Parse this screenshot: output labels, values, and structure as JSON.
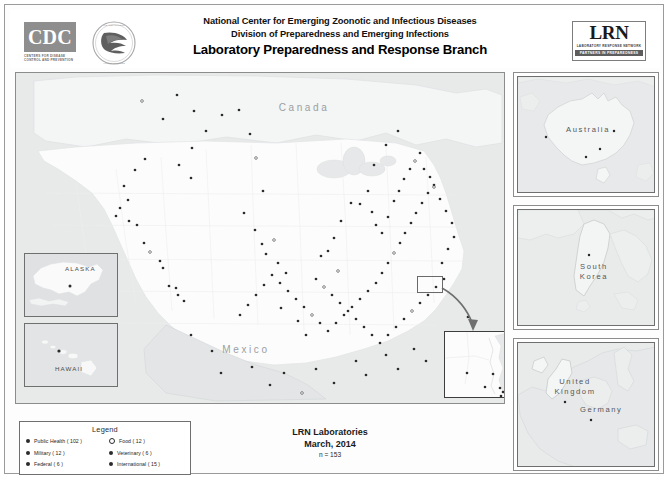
{
  "header": {
    "org_logo": "CDC",
    "cdc_tagline": "CENTERS FOR DISEASE CONTROL AND PREVENTION",
    "line1": "National Center for Emerging Zoonotic and Infectious Diseases",
    "line2": "Division of Preparedness and Emerging Infections",
    "line3": "Laboratory Preparedness and Response Branch",
    "lrn_logo": "LRN",
    "lrn_sub1": "LABORATORY RESPONSE NETWORK",
    "lrn_sub2": "PARTNERS IN PREPAREDNESS"
  },
  "main_map": {
    "country_labels": [
      {
        "name": "Canada",
        "x": 288,
        "y": 38
      },
      {
        "name": "Mexico",
        "x": 230,
        "y": 280
      }
    ],
    "insets": [
      {
        "name": "ALASKA",
        "label": "ALASKA"
      },
      {
        "name": "HAWAII",
        "label": "HAWAII"
      }
    ],
    "callout": {
      "name": "dc-callout",
      "target": "Washington DC metro area"
    },
    "credits": {
      "text": "Mapping & GIS services provided by",
      "icons": [
        "esri-icon",
        "usgs-icon",
        "noaa-icon",
        "nps-icon",
        "census-icon"
      ]
    }
  },
  "right_panels": [
    {
      "name": "australia",
      "label": "Australia",
      "sites": 4
    },
    {
      "name": "south-korea",
      "label": "South\nKorea",
      "label_line1": "South",
      "label_line2": "Korea",
      "sites": 1
    },
    {
      "name": "europe",
      "label_uk": "United\nKingdom",
      "label_uk1": "United",
      "label_uk2": "Kingdom",
      "label_de": "Germany",
      "sites": 2
    }
  ],
  "legend": {
    "title": "Legend",
    "columns": [
      [
        {
          "label": "Public Health ( 102 )",
          "marker": "filled",
          "category": "Public Health",
          "count": 102
        },
        {
          "label": "Military ( 12 )",
          "marker": "filled",
          "category": "Military",
          "count": 12
        },
        {
          "label": "Federal ( 6 )",
          "marker": "filled",
          "category": "Federal",
          "count": 6
        }
      ],
      [
        {
          "label": "Food ( 12 )",
          "marker": "open",
          "category": "Food",
          "count": 12
        },
        {
          "label": "Veterinary ( 6 )",
          "marker": "filled",
          "category": "Veterinary",
          "count": 6
        },
        {
          "label": "International ( 15 )",
          "marker": "filled",
          "category": "International",
          "count": 15
        }
      ]
    ]
  },
  "footer": {
    "title": "LRN Laboratories",
    "date": "March, 2014",
    "count": "n = 153"
  },
  "colors": {
    "land": "#fbfbfb",
    "water": "#e8eaea",
    "dot": "#2b2b2b",
    "frame": "#6f6f6f",
    "label": "#9a9fa2"
  },
  "map_points": {
    "us": [
      [
        126,
        28
      ],
      [
        161,
        22
      ],
      [
        147,
        46
      ],
      [
        176,
        75
      ],
      [
        178,
        38
      ],
      [
        163,
        92
      ],
      [
        175,
        105
      ],
      [
        190,
        58
      ],
      [
        206,
        42
      ],
      [
        223,
        37
      ],
      [
        234,
        61
      ],
      [
        240,
        85
      ],
      [
        247,
        118
      ],
      [
        129,
        86
      ],
      [
        119,
        97
      ],
      [
        108,
        113
      ],
      [
        112,
        127
      ],
      [
        104,
        135
      ],
      [
        100,
        143
      ],
      [
        113,
        148
      ],
      [
        121,
        152
      ],
      [
        128,
        170
      ],
      [
        134,
        179
      ],
      [
        144,
        188
      ],
      [
        153,
        213
      ],
      [
        160,
        215
      ],
      [
        162,
        222
      ],
      [
        168,
        228
      ],
      [
        147,
        195
      ],
      [
        228,
        140
      ],
      [
        239,
        157
      ],
      [
        246,
        171
      ],
      [
        250,
        181
      ],
      [
        258,
        167
      ],
      [
        262,
        190
      ],
      [
        270,
        200
      ],
      [
        265,
        235
      ],
      [
        282,
        248
      ],
      [
        290,
        262
      ],
      [
        305,
        183
      ],
      [
        312,
        178
      ],
      [
        318,
        165
      ],
      [
        325,
        148
      ],
      [
        335,
        130
      ],
      [
        322,
        198
      ],
      [
        344,
        131
      ],
      [
        352,
        118
      ],
      [
        356,
        139
      ],
      [
        360,
        152
      ],
      [
        366,
        160
      ],
      [
        372,
        144
      ],
      [
        378,
        128
      ],
      [
        383,
        118
      ],
      [
        388,
        106
      ],
      [
        394,
        96
      ],
      [
        399,
        88
      ],
      [
        404,
        80
      ],
      [
        408,
        96
      ],
      [
        414,
        104
      ],
      [
        418,
        112
      ],
      [
        412,
        120
      ],
      [
        406,
        130
      ],
      [
        400,
        140
      ],
      [
        395,
        150
      ],
      [
        389,
        160
      ],
      [
        384,
        170
      ],
      [
        378,
        180
      ],
      [
        372,
        190
      ],
      [
        366,
        200
      ],
      [
        360,
        210
      ],
      [
        352,
        218
      ],
      [
        344,
        226
      ],
      [
        336,
        234
      ],
      [
        328,
        242
      ],
      [
        320,
        250
      ],
      [
        312,
        258
      ],
      [
        304,
        250
      ],
      [
        296,
        242
      ],
      [
        288,
        234
      ],
      [
        280,
        226
      ],
      [
        272,
        218
      ],
      [
        264,
        210
      ],
      [
        256,
        202
      ],
      [
        248,
        212
      ],
      [
        240,
        222
      ],
      [
        232,
        232
      ],
      [
        224,
        242
      ],
      [
        300,
        206
      ],
      [
        308,
        214
      ],
      [
        316,
        222
      ],
      [
        324,
        230
      ],
      [
        332,
        238
      ],
      [
        340,
        246
      ],
      [
        348,
        254
      ],
      [
        356,
        262
      ],
      [
        364,
        270
      ],
      [
        372,
        262
      ],
      [
        380,
        254
      ],
      [
        388,
        246
      ],
      [
        396,
        238
      ],
      [
        404,
        230
      ],
      [
        412,
        222
      ],
      [
        420,
        214
      ],
      [
        428,
        206
      ],
      [
        426,
        190
      ],
      [
        432,
        176
      ],
      [
        438,
        164
      ],
      [
        436,
        150
      ],
      [
        430,
        138
      ],
      [
        424,
        126
      ],
      [
        418,
        114
      ],
      [
        236,
        294
      ],
      [
        268,
        300
      ],
      [
        300,
        296
      ],
      [
        340,
        288
      ],
      [
        370,
        282
      ],
      [
        398,
        276
      ],
      [
        196,
        278
      ],
      [
        175,
        262
      ],
      [
        205,
        300
      ],
      [
        254,
        312
      ],
      [
        286,
        320
      ],
      [
        318,
        310
      ],
      [
        350,
        302
      ],
      [
        382,
        296
      ],
      [
        410,
        288
      ],
      [
        436,
        280
      ],
      [
        444,
        262
      ],
      [
        452,
        244
      ],
      [
        358,
        92
      ],
      [
        370,
        72
      ],
      [
        382,
        58
      ]
    ],
    "alaska": [
      [
        45,
        44
      ],
      [
        53,
        50
      ]
    ],
    "hawaii": [
      [
        34,
        43
      ],
      [
        55,
        55
      ]
    ],
    "dc_inset": [
      [
        22,
        41
      ],
      [
        48,
        42
      ],
      [
        55,
        56
      ],
      [
        58,
        60
      ],
      [
        56,
        64
      ],
      [
        40,
        55
      ]
    ],
    "australia": [
      [
        28,
        60
      ],
      [
        82,
        72
      ],
      [
        96,
        54
      ],
      [
        68,
        80
      ]
    ],
    "korea": [
      [
        71,
        45
      ]
    ],
    "europe": [
      [
        47,
        59
      ],
      [
        73,
        77
      ]
    ]
  }
}
